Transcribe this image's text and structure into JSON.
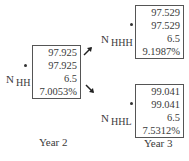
{
  "nodes": {
    "nhh": {
      "label_main": "N",
      "label_sub": "HH",
      "values": [
        "97.925",
        "97.925",
        "6.5",
        "7.0053%"
      ]
    },
    "nhhh": {
      "label_main": "N",
      "label_sub": "HHH",
      "values": [
        "97.529",
        "97.529",
        "6.5",
        "9.1987%"
      ]
    },
    "nhhl": {
      "label_main": "N",
      "label_sub": "HHL",
      "values": [
        "99.041",
        "99.041",
        "6.5",
        "7.5312%"
      ]
    }
  },
  "years": {
    "year2": "Year 2",
    "year3": "Year 3"
  }
}
